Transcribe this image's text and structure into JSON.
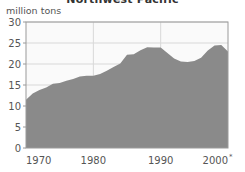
{
  "chart_data": {
    "type": "area",
    "title": "Northwest Pacific",
    "ylabel": "million tons",
    "xlabel": "",
    "ylim": [
      0,
      30
    ],
    "xlim": [
      1970,
      2000
    ],
    "yticks": [
      0,
      5,
      10,
      15,
      20,
      25,
      30
    ],
    "ytick_labels": [
      "0",
      "5",
      "10",
      "15",
      "20",
      "25",
      "30"
    ],
    "xticks": [
      1970,
      1980,
      1990,
      2000
    ],
    "xtick_labels": [
      "1970",
      "1980",
      "1990",
      "2000"
    ],
    "xtick_note": "*",
    "grid": true,
    "legend": "none",
    "series_name": "Northwest Pacific catch",
    "x": [
      1970,
      1971,
      1972,
      1973,
      1974,
      1975,
      1976,
      1977,
      1978,
      1979,
      1980,
      1981,
      1982,
      1983,
      1984,
      1985,
      1986,
      1987,
      1988,
      1989,
      1990,
      1991,
      1992,
      1993,
      1994,
      1995,
      1996,
      1997,
      1998,
      1999,
      2000
    ],
    "values": [
      11.5,
      13.0,
      13.8,
      14.4,
      15.3,
      15.5,
      16.0,
      16.4,
      17.0,
      17.2,
      17.2,
      17.6,
      18.4,
      19.3,
      20.1,
      22.2,
      22.3,
      23.3,
      24.0,
      23.9,
      23.9,
      22.6,
      21.3,
      20.6,
      20.5,
      20.7,
      21.5,
      23.2,
      24.4,
      24.5,
      23.0
    ],
    "colors": {
      "area_fill": "#8a8a8a",
      "plot_background": "#fafafa",
      "grid": "#d8d8d8",
      "axis": "#9a9a9a",
      "text": "#555555",
      "title_text": "#333333"
    }
  }
}
